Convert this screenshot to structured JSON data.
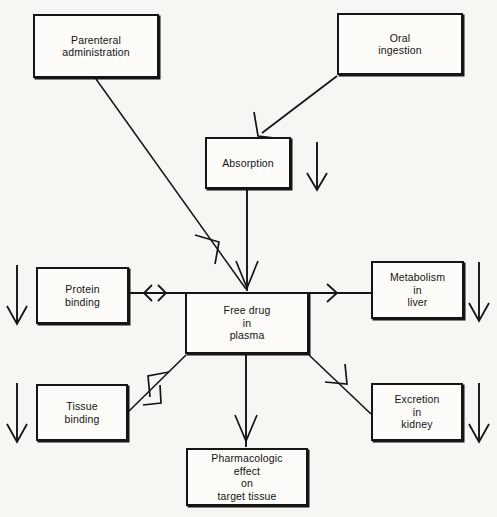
{
  "diagram": {
    "background_color": "#f7f6f2",
    "stroke_color": "#151515",
    "text_color": "#131313",
    "nodes": [
      {
        "id": "parenteral",
        "label": "Parenteral\nadministration"
      },
      {
        "id": "oral",
        "label": "Oral\ningestion"
      },
      {
        "id": "absorption",
        "label": "Absorption"
      },
      {
        "id": "free_drug",
        "label": "Free drug\nin\nplasma"
      },
      {
        "id": "protein",
        "label": "Protein\nbinding"
      },
      {
        "id": "tissue",
        "label": "Tissue\nbinding"
      },
      {
        "id": "metabolism",
        "label": "Metabolism\nin\nliver"
      },
      {
        "id": "excretion",
        "label": "Excretion\nin\nkidney"
      },
      {
        "id": "pharm",
        "label": "Pharmacologic\neffect\non\ntarget tissue"
      }
    ],
    "edges": [
      {
        "id": "oral-to-absorption",
        "from": "oral",
        "to": "absorption",
        "arrow": "single"
      },
      {
        "id": "parenteral-to-free-drug",
        "from": "parenteral",
        "to": "free_drug",
        "arrow": "single"
      },
      {
        "id": "absorption-to-free-drug",
        "from": "absorption",
        "to": "free_drug",
        "arrow": "single"
      },
      {
        "id": "protein-to-free-drug",
        "from": "protein",
        "to": "free_drug",
        "arrow": "double"
      },
      {
        "id": "free-drug-to-metabolism",
        "from": "free_drug",
        "to": "metabolism",
        "arrow": "single"
      },
      {
        "id": "free-drug-to-tissue",
        "from": "free_drug",
        "to": "tissue",
        "arrow": "double"
      },
      {
        "id": "free-drug-to-excretion",
        "from": "free_drug",
        "to": "excretion",
        "arrow": "single"
      },
      {
        "id": "free-drug-to-pharm",
        "from": "free_drug",
        "to": "pharm",
        "arrow": "single"
      }
    ],
    "decorative_arrows": [
      {
        "id": "absorption-flow-arrow",
        "direction": "down"
      },
      {
        "id": "protein-flow-arrow",
        "direction": "down"
      },
      {
        "id": "tissue-flow-arrow",
        "direction": "down"
      },
      {
        "id": "metabolism-flow-arrow",
        "direction": "down"
      },
      {
        "id": "excretion-flow-arrow",
        "direction": "down"
      }
    ]
  }
}
